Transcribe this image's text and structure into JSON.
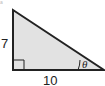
{
  "diagram": {
    "type": "right-triangle",
    "fill_color": "#e2e2e2",
    "stroke_color": "#222222",
    "vertical_leg_label": "7",
    "horizontal_leg_label": "10",
    "angle_label": "θ",
    "corner_mark": "a",
    "right_angle_marker": true
  }
}
